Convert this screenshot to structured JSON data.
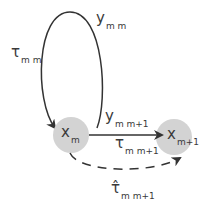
{
  "diagram": {
    "nodes": [
      {
        "id": "xm",
        "label": "x",
        "subscript": "m"
      },
      {
        "id": "xm1",
        "label": "x",
        "subscript": "m+1"
      }
    ],
    "edges": [
      {
        "from": "xm",
        "to": "xm",
        "style": "solid",
        "label_top": {
          "main": "y",
          "sub": "m m"
        },
        "label_side": {
          "main": "τ",
          "sub": "m m"
        }
      },
      {
        "from": "xm",
        "to": "xm1",
        "style": "solid",
        "label_top": {
          "main": "y",
          "sub": "m m+1"
        },
        "label_bottom": {
          "main": "τ",
          "sub": "m m+1"
        }
      },
      {
        "from": "xm",
        "to": "xm1",
        "style": "dashed",
        "label": {
          "main": "τ̂",
          "sub": "m m+1"
        }
      }
    ],
    "colors": {
      "node_fill": "#d3d3d3",
      "stroke": "#333333"
    }
  }
}
